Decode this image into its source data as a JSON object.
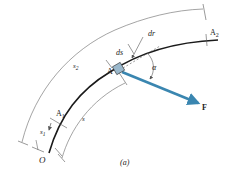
{
  "figure": {
    "caption": "(a)",
    "colors": {
      "path": "#1a1a1a",
      "dimension_lines": "#555555",
      "force_arrow": "#3a86b0",
      "particle": "#9ab8cc"
    },
    "labels": {
      "origin": "O",
      "point_a1": "A",
      "point_a1_sub": "1",
      "point_a2": "A",
      "point_a2_sub": "2",
      "point_a": "A",
      "s1": "s",
      "s1_sub": "1",
      "s2": "s",
      "s2_sub": "2",
      "s": "s",
      "ds": "ds",
      "dr": "dr",
      "alpha": "α",
      "force": "F"
    }
  }
}
